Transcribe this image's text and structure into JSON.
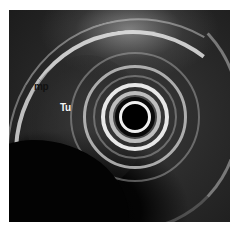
{
  "image": {
    "type": "endoscopic ultrasound",
    "description": "Radial EUS grayscale image with concentric probe rings at center and annotated layers",
    "labels": [
      {
        "id": "mp",
        "text": "mp",
        "color": "#111111"
      },
      {
        "id": "tu",
        "text": "Tu",
        "color": "#f4f4f4"
      }
    ]
  }
}
